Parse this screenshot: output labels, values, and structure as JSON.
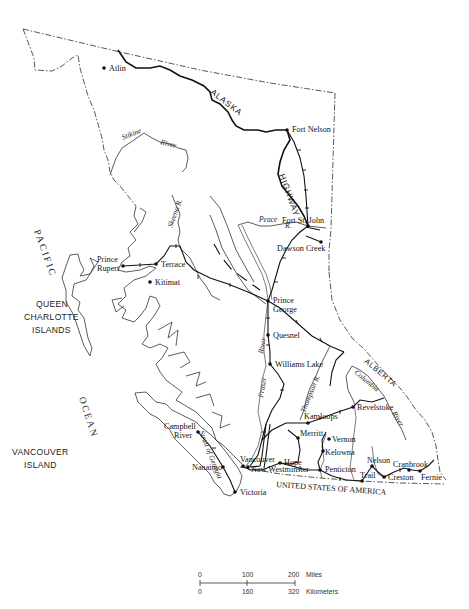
{
  "map": {
    "title": "British Columbia transportation map",
    "cities": [
      {
        "name": "Atlin",
        "x": 104,
        "y": 68,
        "lx": 109,
        "ly": 71
      },
      {
        "name": "Fort Nelson",
        "x": 287,
        "y": 130,
        "lx": 292,
        "ly": 130
      },
      {
        "name": "Fort St. John",
        "x": 308,
        "y": 226,
        "lx": 283,
        "ly": 222
      },
      {
        "name": "Dawson Creek",
        "x": 321,
        "y": 242,
        "lx": 277,
        "ly": 250
      },
      {
        "name": "Prince Rupert",
        "x": 123,
        "y": 266,
        "lx": "",
        "ly": ""
      },
      {
        "name": "Terrace",
        "x": 156,
        "y": 264,
        "lx": 161,
        "ly": 267
      },
      {
        "name": "Kitimat",
        "x": 150,
        "y": 282,
        "lx": 155,
        "ly": 285
      },
      {
        "name": "Prince George",
        "x": 268,
        "y": 301,
        "lx": "",
        "ly": ""
      },
      {
        "name": "Quesnel",
        "x": 268,
        "y": 335,
        "lx": 273,
        "ly": 338
      },
      {
        "name": "Williams Lake",
        "x": 270,
        "y": 364,
        "lx": 275,
        "ly": 367
      },
      {
        "name": "Revelstoke",
        "x": 353,
        "y": 407,
        "lx": 357,
        "ly": 409
      },
      {
        "name": "Kamloops",
        "x": 308,
        "y": 423,
        "lx": 302,
        "ly": 419
      },
      {
        "name": "Merritt",
        "x": 298,
        "y": 438,
        "lx": 300,
        "ly": 436
      },
      {
        "name": "Vernon",
        "x": 329,
        "y": 439,
        "lx": 333,
        "ly": 442
      },
      {
        "name": "Kelowna",
        "x": 323,
        "y": 451,
        "lx": 325,
        "ly": 454
      },
      {
        "name": "Campbell River",
        "x": 198,
        "y": 432,
        "lx": "",
        "ly": ""
      },
      {
        "name": "Nanaimo",
        "x": 223,
        "y": 467,
        "lx": 192,
        "ly": 470
      },
      {
        "name": "Vancouver",
        "x": 243,
        "y": 466,
        "lx": 240,
        "ly": 463
      },
      {
        "name": "New Westminster",
        "x": 248,
        "y": 467,
        "lx": 251,
        "ly": 473
      },
      {
        "name": "Hope",
        "x": 280,
        "y": 463,
        "lx": 284,
        "ly": 466
      },
      {
        "name": "Penticton",
        "x": 320,
        "y": 470,
        "lx": 325,
        "ly": 472
      },
      {
        "name": "Nelson",
        "x": 372,
        "y": 466,
        "lx": 366,
        "ly": 463
      },
      {
        "name": "Trail",
        "x": 362,
        "y": 481,
        "lx": 360,
        "ly": 478
      },
      {
        "name": "Cranbrook",
        "x": 409,
        "y": 470,
        "lx": 392,
        "ly": 467
      },
      {
        "name": "Creston",
        "x": 384,
        "y": 477,
        "lx": 388,
        "ly": 480
      },
      {
        "name": "Fernie",
        "x": 420,
        "y": 471,
        "lx": 421,
        "ly": 480
      },
      {
        "name": "Victoria",
        "x": 235,
        "y": 492,
        "lx": 240,
        "ly": 495
      }
    ],
    "multi_labels": {
      "prince_rupert": [
        "Prince",
        "Rupert"
      ],
      "prince_george": [
        "Prince",
        "George"
      ],
      "campbell_river": [
        "Campbell",
        "River"
      ],
      "queen_charlotte": [
        "QUEEN",
        "CHARLOTTE",
        "ISLANDS"
      ],
      "vancouver_island": [
        "VANCOUVER",
        "ISLAND"
      ]
    },
    "water_labels": {
      "pacific": "PACIFIC",
      "ocean": "OCEAN",
      "stikine": "Stikine",
      "stikine_river": "River",
      "skeena": "Skeena R.",
      "peace": "Peace",
      "peace_r": "R.",
      "fraser": "Fraser",
      "fraser_river": "River",
      "thompson": "Thompson R.",
      "columbia": "Columbia",
      "columbia_river": "River",
      "strait": "Strait of Georgia"
    },
    "region_labels": {
      "alaska": "ALASKA",
      "highway": "HIGHWAY",
      "alberta": "ALBERTA",
      "usa": "UNITED STATES OF AMERICA"
    }
  },
  "scale": {
    "miles": [
      "0",
      "100",
      "200"
    ],
    "miles_unit": "Miles",
    "km": [
      "0",
      "160",
      "320"
    ],
    "km_unit": "Kilometers"
  }
}
